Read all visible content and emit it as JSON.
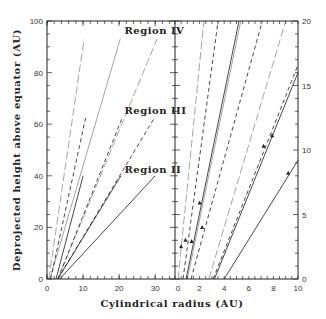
{
  "chart_data": {
    "type": "line",
    "layout": "two panels sharing a frame",
    "xlabel": "Cylindrical radius (AU)",
    "ylabel": "Deprojected height above equator (AU)",
    "grid": false,
    "legend": null,
    "panels": [
      {
        "name": "left",
        "xlim": [
          0,
          35.5
        ],
        "ylim": [
          0,
          100
        ],
        "x_ticks": [
          "0",
          "10",
          "20",
          "30"
        ],
        "y_ticks": [
          "0",
          "20",
          "40",
          "60",
          "80",
          "100"
        ],
        "annotations": [
          {
            "text": "Region IV",
            "x": 21.5,
            "y": 95
          },
          {
            "text": "Region III",
            "x": 21.5,
            "y": 64
          },
          {
            "text": "Region II",
            "x": 21.5,
            "y": 41
          }
        ],
        "series": [
          {
            "name": "Region IV inner",
            "style": "longdash",
            "points": [
              [
                0.5,
                0
              ],
              [
                10.3,
                93
              ]
            ]
          },
          {
            "name": "Region IV mid",
            "style": "thin",
            "points": [
              [
                0.8,
                0
              ],
              [
                20.3,
                93
              ]
            ]
          },
          {
            "name": "Region IV outer",
            "style": "longdash",
            "points": [
              [
                3,
                0
              ],
              [
                30.5,
                93
              ]
            ]
          },
          {
            "name": "Region III inner",
            "style": "dash",
            "points": [
              [
                1,
                0
              ],
              [
                10.8,
                63
              ]
            ]
          },
          {
            "name": "Region III mid",
            "style": "dash",
            "points": [
              [
                3,
                0
              ],
              [
                21,
                63
              ]
            ]
          },
          {
            "name": "Region III outer",
            "style": "dash",
            "points": [
              [
                3,
                0
              ],
              [
                30,
                63
              ]
            ]
          },
          {
            "name": "Region II inner",
            "style": "solid",
            "points": [
              [
                2.5,
                0
              ],
              [
                10,
                40
              ]
            ]
          },
          {
            "name": "Region II mid",
            "style": "solid",
            "points": [
              [
                3,
                0
              ],
              [
                20.5,
                40
              ]
            ]
          },
          {
            "name": "Region II outer",
            "style": "solid",
            "points": [
              [
                3.5,
                0
              ],
              [
                30,
                40
              ]
            ]
          }
        ]
      },
      {
        "name": "right",
        "xlim": [
          0,
          10
        ],
        "ylim": [
          0,
          20
        ],
        "x_ticks": [
          "0",
          "2",
          "4",
          "6",
          "8",
          "10"
        ],
        "y_ticks": [
          "0",
          "5",
          "10",
          "15",
          "20"
        ],
        "series": [
          {
            "name": "A",
            "style": "longdash",
            "points": [
              [
                0.25,
                0
              ],
              [
                2.35,
                20
              ]
            ]
          },
          {
            "name": "B",
            "style": "dash",
            "points": [
              [
                0.65,
                0
              ],
              [
                3.5,
                20
              ]
            ]
          },
          {
            "name": "C",
            "style": "solid",
            "points": [
              [
                0.9,
                0
              ],
              [
                5.2,
                20
              ]
            ]
          },
          {
            "name": "D",
            "style": "thin",
            "points": [
              [
                1.0,
                0
              ],
              [
                5.35,
                20
              ]
            ]
          },
          {
            "name": "E",
            "style": "dash",
            "points": [
              [
                1.3,
                0
              ],
              [
                7.1,
                20
              ]
            ]
          },
          {
            "name": "F",
            "style": "longdash",
            "points": [
              [
                2.75,
                0
              ],
              [
                9.0,
                20
              ]
            ]
          },
          {
            "name": "G",
            "style": "dash",
            "points": [
              [
                3.1,
                0
              ],
              [
                10,
                16.6
              ]
            ]
          },
          {
            "name": "H",
            "style": "solid",
            "points": [
              [
                3.2,
                0
              ],
              [
                10,
                16.0
              ]
            ]
          },
          {
            "name": "I",
            "style": "solid",
            "points": [
              [
                4.0,
                0
              ],
              [
                10,
                9.2
              ]
            ]
          }
        ],
        "markers": [
          {
            "shape": "triangle",
            "x": 0.5,
            "y": 2.5
          },
          {
            "shape": "triangle",
            "x": 0.85,
            "y": 3.0
          },
          {
            "shape": "triangle",
            "x": 1.35,
            "y": 2.9
          },
          {
            "shape": "triangle",
            "x": 2.0,
            "y": 5.9
          },
          {
            "shape": "triangle",
            "x": 2.2,
            "y": 4.0
          },
          {
            "shape": "triangle",
            "x": 7.2,
            "y": 10.3
          },
          {
            "shape": "triangle",
            "x": 7.9,
            "y": 11.1
          },
          {
            "shape": "triangle",
            "x": 9.2,
            "y": 8.2
          }
        ]
      }
    ]
  }
}
